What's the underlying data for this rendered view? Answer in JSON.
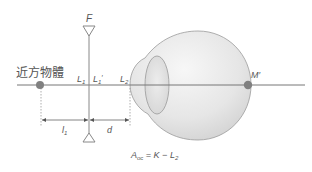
{
  "diagram": {
    "title": "",
    "labels": {
      "object": "近方物體",
      "far_point": "F",
      "L1": "L",
      "L1_sub": "1",
      "L1p": "L",
      "L1p_sub": "1",
      "L1p_prime": "′",
      "L2": "L",
      "L2_sub": "2",
      "M": "M′",
      "l1": "l",
      "l1_sub": "1",
      "d": "d",
      "formula_A": "A",
      "formula_A_sub": "oc",
      "formula_rest": " = K − L",
      "formula_L_sub": "2"
    },
    "colors": {
      "line": "#777777",
      "dot": "#808080",
      "eye_fill_light": "#f4f4f4",
      "eye_fill_dark": "#d6d6d6",
      "eye_stroke": "#9a9a9a",
      "text": "#555555"
    }
  }
}
